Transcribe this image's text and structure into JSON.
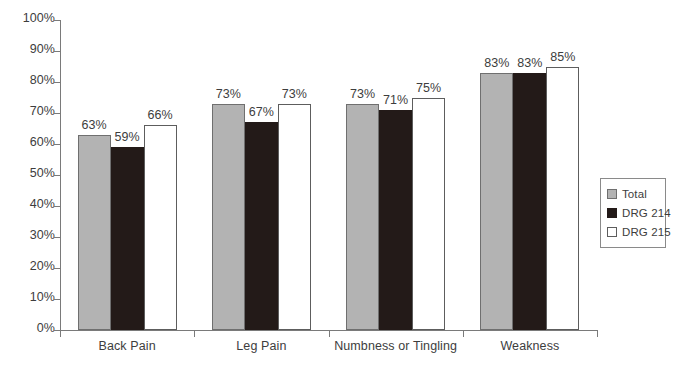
{
  "chart_data": {
    "type": "bar",
    "title": "",
    "xlabel": "",
    "ylabel": "",
    "ylim": [
      0,
      100
    ],
    "grid": false,
    "legend_position": "right",
    "categories": [
      "Back Pain",
      "Leg Pain",
      "Numbness or Tingling",
      "Weakness"
    ],
    "ytick_labels": [
      "100%",
      "90%",
      "80%",
      "70%",
      "60%",
      "50%",
      "40%",
      "30%",
      "20%",
      "10%",
      "0%"
    ],
    "ytick_values": [
      100,
      90,
      80,
      70,
      60,
      50,
      40,
      30,
      20,
      10,
      0
    ],
    "series": [
      {
        "name": "Total",
        "color": "#b3b3b3",
        "values": [
          63,
          73,
          73,
          83
        ],
        "labels": [
          "63%",
          "73%",
          "73%",
          "83%"
        ]
      },
      {
        "name": "DRG 214",
        "color": "#231a18",
        "values": [
          59,
          67,
          71,
          83
        ],
        "labels": [
          "59%",
          "67%",
          "71%",
          "83%"
        ]
      },
      {
        "name": "DRG 215",
        "color": "#ffffff",
        "values": [
          66,
          73,
          75,
          85
        ],
        "labels": [
          "66%",
          "73%",
          "75%",
          "85%"
        ]
      }
    ]
  },
  "legend": {
    "items": [
      {
        "label": "Total",
        "swatch": "total"
      },
      {
        "label": "DRG 214",
        "swatch": "drg214"
      },
      {
        "label": "DRG 215",
        "swatch": "drg215"
      }
    ]
  }
}
